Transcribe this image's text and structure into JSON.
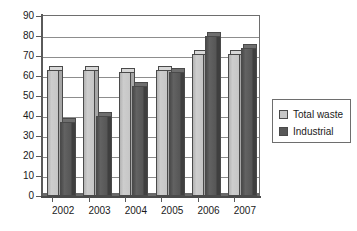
{
  "chart_data": {
    "type": "bar",
    "title": "",
    "xlabel": "",
    "ylabel": "",
    "categories": [
      "2002",
      "2003",
      "2004",
      "2005",
      "2006",
      "2007"
    ],
    "series": [
      {
        "name": "Total waste",
        "color": "#c6c6c6",
        "values": [
          65,
          65,
          64,
          65,
          73,
          73
        ]
      },
      {
        "name": "Industrial",
        "color": "#585858",
        "values": [
          39,
          42,
          57,
          64,
          82,
          76
        ]
      }
    ],
    "ylim": [
      0,
      90
    ],
    "ytick_step": 10,
    "yticks": [
      "0",
      "10",
      "20",
      "30",
      "40",
      "50",
      "60",
      "70",
      "80",
      "90"
    ],
    "grid": true,
    "legend_position": "right"
  },
  "legend": {
    "items": [
      {
        "label": "Total waste",
        "swatch": "total-waste-swatch"
      },
      {
        "label": "Industrial",
        "swatch": "industrial-swatch"
      }
    ]
  }
}
